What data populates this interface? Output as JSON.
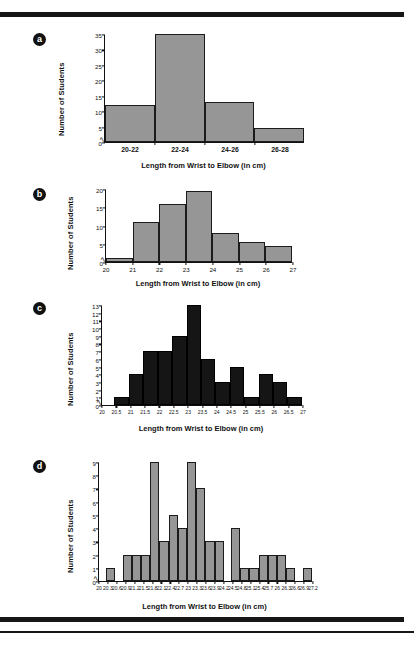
{
  "page": {
    "bullets": [
      "a",
      "b",
      "c",
      "d"
    ],
    "shared_xlabel": "Length from Wrist to Elbow (in cm)",
    "shared_ylabel": "Number of Students",
    "bar_gray": "#969696",
    "bar_dark": "#151515",
    "rule_color": "#161616"
  },
  "chart_data": [
    {
      "id": "a",
      "type": "bar",
      "title": "",
      "xlabel": "Length from Wrist to Elbow (in cm)",
      "ylabel": "Number of Students",
      "categories": [
        "20-22",
        "22-24",
        "24-26",
        "26-28"
      ],
      "values": [
        12,
        35,
        13,
        4.5
      ],
      "yticks": [
        0,
        5,
        10,
        15,
        20,
        25,
        30,
        35
      ],
      "ylim": [
        0,
        35
      ],
      "grid": false,
      "legend": "none",
      "axis_break": true,
      "bar_color": "#969696"
    },
    {
      "id": "b",
      "type": "bar",
      "title": "",
      "xlabel": "Length from Wrist to Elbow (in cm)",
      "ylabel": "Number of Students",
      "bin_edges": [
        20,
        21,
        22,
        23,
        24,
        25,
        26,
        27
      ],
      "xticks": [
        "20",
        "21",
        "22",
        "23",
        "24",
        "25",
        "26",
        "27"
      ],
      "values": [
        1,
        11,
        16,
        19.5,
        8,
        5.5,
        4.5
      ],
      "yticks": [
        0,
        5,
        10,
        15,
        20
      ],
      "ylim": [
        0,
        20
      ],
      "grid": false,
      "legend": "none",
      "axis_break": true,
      "bar_color": "#969696"
    },
    {
      "id": "c",
      "type": "bar",
      "title": "",
      "xlabel": "Length from Wrist to Elbow (in cm)",
      "ylabel": "Number of Students",
      "bin_edges": [
        20,
        20.5,
        21,
        21.5,
        22,
        22.5,
        23,
        23.5,
        24,
        24.5,
        25,
        25.5,
        26,
        26.5,
        27
      ],
      "xticks": [
        "20",
        "20.5",
        "21",
        "21.5",
        "22",
        "22.5",
        "23",
        "23.5",
        "24",
        "24.5",
        "25",
        "25.5",
        "26",
        "26.5",
        "27"
      ],
      "values": [
        0,
        1,
        4,
        7,
        7,
        9,
        13,
        6,
        3,
        5,
        1,
        4,
        3,
        1
      ],
      "yticks": [
        0,
        1,
        2,
        3,
        4,
        5,
        6,
        7,
        8,
        9,
        10,
        11,
        12,
        13
      ],
      "ylim": [
        0,
        13
      ],
      "grid": false,
      "legend": "none",
      "axis_break": true,
      "bar_color": "#151515"
    },
    {
      "id": "d",
      "type": "bar",
      "title": "",
      "xlabel": "Length from Wrist to Elbow (in cm)",
      "ylabel": "Number of Students",
      "bin_edges": [
        20,
        20.3,
        20.6,
        20.9,
        21.2,
        21.5,
        21.8,
        22.1,
        22.4,
        22.7,
        23,
        23.3,
        23.6,
        23.9,
        24.2,
        24.5,
        24.8,
        25.1,
        25.4,
        25.7,
        26,
        26.3,
        26.6,
        26.9,
        27.2
      ],
      "xticks": [
        "20",
        "20.3",
        "20.6",
        "20.9",
        "21.2",
        "21.5",
        "21.8",
        "22.1",
        "22.4",
        "22.7",
        "23",
        "23.3",
        "23.6",
        "23.9",
        "24.2",
        "24.5",
        "24.8",
        "25.1",
        "25.4",
        "25.7",
        "26",
        "26.3",
        "26.6",
        "26.9",
        "27.2"
      ],
      "values": [
        0,
        1,
        0,
        2,
        2,
        2,
        9,
        3,
        5,
        4,
        9,
        7,
        3,
        3,
        0,
        4,
        1,
        1,
        2,
        2,
        2,
        1,
        0,
        1
      ],
      "yticks": [
        0,
        1,
        2,
        3,
        4,
        5,
        6,
        7,
        8,
        9
      ],
      "ylim": [
        0,
        9
      ],
      "grid": false,
      "legend": "none",
      "axis_break": true,
      "bar_color": "#969696"
    }
  ]
}
